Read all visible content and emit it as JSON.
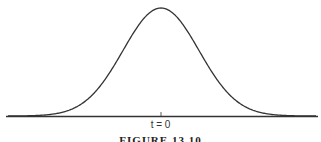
{
  "chart_data": {
    "type": "line",
    "title": "",
    "xlabel": "",
    "ylabel": "",
    "x_tick_labels": [
      "t = 0"
    ],
    "series": [
      {
        "name": "Gaussian pulse",
        "shape": "bell curve centered at t = 0"
      }
    ],
    "grid": false,
    "legend": "none",
    "color": "#333333"
  },
  "figure": {
    "tick_label": "t = 0",
    "caption": "FIGURE 13.10"
  }
}
